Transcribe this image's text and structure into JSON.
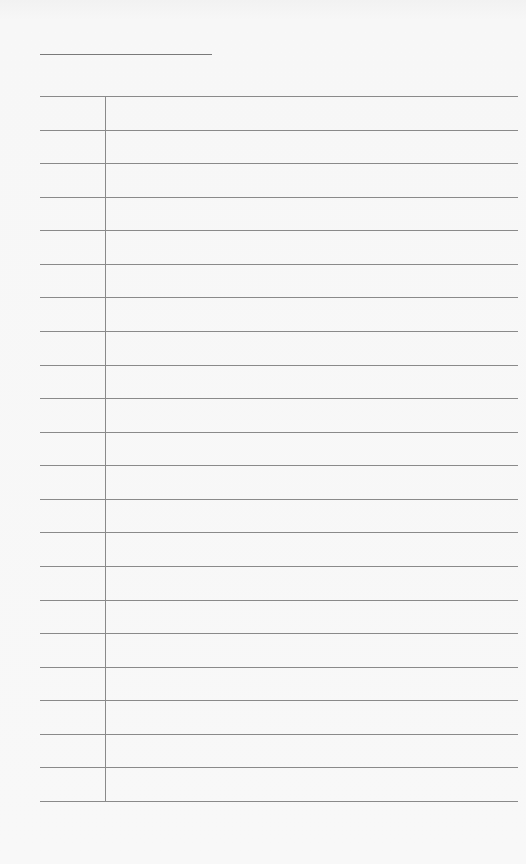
{
  "document": {
    "type": "blank lined notepad page",
    "title_line": {
      "present": true
    },
    "ruled_area": {
      "line_count": 22,
      "row_count": 21,
      "margin_line": true,
      "rows": [
        "",
        "",
        "",
        "",
        "",
        "",
        "",
        "",
        "",
        "",
        "",
        "",
        "",
        "",
        "",
        "",
        "",
        "",
        "",
        "",
        ""
      ]
    },
    "colors": {
      "paper": "#f6f6f6",
      "lines": "#8a8a8a"
    }
  }
}
